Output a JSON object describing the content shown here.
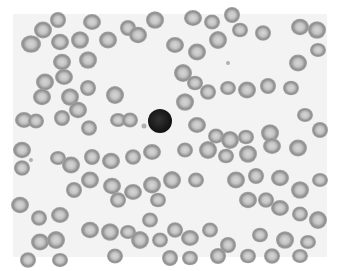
{
  "image": {
    "subject": "Blood smear micrograph",
    "description": "Field of red blood cells with a single dark-staining lymphocyte near center",
    "background_color": "#ffffff",
    "field_color": "#f4f4f4",
    "rbc_rim_color": "#8a8a8a",
    "rbc_center_color": "#cfcfcf",
    "lymphocyte_color": "#1a1a1a",
    "lymphocyte": {
      "cx": 160,
      "cy": 121,
      "r": 12
    },
    "platelets": [
      {
        "cx": 144,
        "cy": 126,
        "r": 2.5
      },
      {
        "cx": 31,
        "cy": 160,
        "r": 2
      },
      {
        "cx": 228,
        "cy": 63,
        "r": 2
      }
    ],
    "cells": [
      [
        31,
        44,
        10
      ],
      [
        43,
        30,
        9
      ],
      [
        58,
        20,
        8
      ],
      [
        60,
        42,
        9
      ],
      [
        80,
        40,
        9
      ],
      [
        92,
        22,
        9
      ],
      [
        108,
        40,
        9
      ],
      [
        128,
        28,
        8
      ],
      [
        62,
        62,
        9
      ],
      [
        88,
        60,
        9
      ],
      [
        64,
        77,
        9
      ],
      [
        45,
        82,
        9
      ],
      [
        88,
        88,
        8
      ],
      [
        42,
        97,
        9
      ],
      [
        70,
        97,
        9
      ],
      [
        24,
        120,
        9
      ],
      [
        36,
        121,
        8
      ],
      [
        62,
        118,
        8
      ],
      [
        78,
        110,
        9
      ],
      [
        89,
        128,
        8
      ],
      [
        118,
        120,
        8
      ],
      [
        130,
        120,
        8
      ],
      [
        115,
        95,
        9
      ],
      [
        138,
        35,
        9
      ],
      [
        155,
        20,
        9
      ],
      [
        175,
        45,
        9
      ],
      [
        197,
        52,
        9
      ],
      [
        218,
        40,
        9
      ],
      [
        240,
        30,
        8
      ],
      [
        263,
        33,
        8
      ],
      [
        193,
        18,
        9
      ],
      [
        212,
        22,
        8
      ],
      [
        232,
        15,
        8
      ],
      [
        300,
        27,
        9
      ],
      [
        317,
        30,
        9
      ],
      [
        318,
        50,
        8
      ],
      [
        298,
        63,
        9
      ],
      [
        183,
        73,
        9
      ],
      [
        195,
        83,
        8
      ],
      [
        208,
        92,
        8
      ],
      [
        228,
        88,
        8
      ],
      [
        247,
        90,
        9
      ],
      [
        268,
        86,
        8
      ],
      [
        291,
        88,
        8
      ],
      [
        185,
        102,
        9
      ],
      [
        197,
        125,
        9
      ],
      [
        216,
        136,
        8
      ],
      [
        230,
        140,
        9
      ],
      [
        246,
        137,
        8
      ],
      [
        270,
        133,
        9
      ],
      [
        305,
        115,
        8
      ],
      [
        185,
        150,
        8
      ],
      [
        208,
        150,
        9
      ],
      [
        226,
        156,
        8
      ],
      [
        248,
        154,
        9
      ],
      [
        272,
        146,
        9
      ],
      [
        298,
        148,
        9
      ],
      [
        320,
        130,
        8
      ],
      [
        22,
        150,
        9
      ],
      [
        22,
        168,
        8
      ],
      [
        58,
        158,
        8
      ],
      [
        71,
        165,
        9
      ],
      [
        92,
        157,
        8
      ],
      [
        111,
        161,
        9
      ],
      [
        133,
        157,
        8
      ],
      [
        152,
        152,
        9
      ],
      [
        90,
        180,
        9
      ],
      [
        74,
        190,
        8
      ],
      [
        112,
        186,
        9
      ],
      [
        118,
        200,
        8
      ],
      [
        133,
        192,
        9
      ],
      [
        152,
        185,
        9
      ],
      [
        172,
        180,
        9
      ],
      [
        20,
        205,
        9
      ],
      [
        39,
        218,
        8
      ],
      [
        60,
        215,
        9
      ],
      [
        40,
        242,
        9
      ],
      [
        56,
        240,
        9
      ],
      [
        90,
        230,
        9
      ],
      [
        110,
        232,
        9
      ],
      [
        128,
        232,
        8
      ],
      [
        150,
        220,
        8
      ],
      [
        140,
        240,
        9
      ],
      [
        158,
        200,
        8
      ],
      [
        175,
        230,
        8
      ],
      [
        190,
        238,
        9
      ],
      [
        210,
        230,
        8
      ],
      [
        228,
        245,
        8
      ],
      [
        248,
        200,
        9
      ],
      [
        266,
        200,
        8
      ],
      [
        280,
        208,
        9
      ],
      [
        300,
        214,
        8
      ],
      [
        318,
        220,
        9
      ],
      [
        260,
        235,
        8
      ],
      [
        285,
        240,
        9
      ],
      [
        308,
        242,
        8
      ],
      [
        236,
        180,
        9
      ],
      [
        256,
        176,
        8
      ],
      [
        280,
        178,
        9
      ],
      [
        300,
        190,
        9
      ],
      [
        320,
        180,
        8
      ],
      [
        196,
        180,
        8
      ],
      [
        170,
        258,
        8
      ],
      [
        190,
        258,
        8
      ],
      [
        28,
        260,
        8
      ],
      [
        60,
        260,
        8
      ],
      [
        115,
        256,
        8
      ],
      [
        218,
        256,
        8
      ],
      [
        248,
        256,
        8
      ],
      [
        272,
        256,
        8
      ],
      [
        300,
        256,
        8
      ],
      [
        160,
        240,
        8
      ]
    ]
  }
}
